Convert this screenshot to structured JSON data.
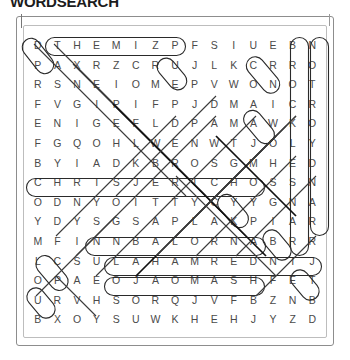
{
  "title": "WORDSEARCH",
  "puzzle": {
    "type": "word-search",
    "rows": 15,
    "cols": 15,
    "grid": [
      [
        "D",
        "T",
        "H",
        "E",
        "M",
        "I",
        "Z",
        "P",
        "F",
        "S",
        "I",
        "U",
        "E",
        "B",
        "N"
      ],
      [
        "P",
        "A",
        "X",
        "R",
        "Z",
        "C",
        "R",
        "U",
        "J",
        "L",
        "K",
        "C",
        "R",
        "R",
        "O"
      ],
      [
        "R",
        "S",
        "N",
        "E",
        "I",
        "O",
        "M",
        "E",
        "P",
        "V",
        "W",
        "O",
        "N",
        "O",
        "T"
      ],
      [
        "F",
        "V",
        "G",
        "I",
        "P",
        "I",
        "F",
        "P",
        "J",
        "D",
        "M",
        "A",
        "I",
        "C",
        "R"
      ],
      [
        "E",
        "N",
        "I",
        "G",
        "E",
        "F",
        "L",
        "D",
        "P",
        "A",
        "M",
        "A",
        "W",
        "K",
        "O"
      ],
      [
        "F",
        "G",
        "Q",
        "O",
        "H",
        "L",
        "W",
        "E",
        "N",
        "W",
        "T",
        "J",
        "O",
        "L",
        "Y"
      ],
      [
        "B",
        "Y",
        "I",
        "A",
        "D",
        "K",
        "B",
        "R",
        "O",
        "S",
        "G",
        "M",
        "H",
        "E",
        "D"
      ],
      [
        "C",
        "H",
        "R",
        "I",
        "S",
        "J",
        "E",
        "R",
        "I",
        "C",
        "H",
        "O",
        "S",
        "S",
        "N"
      ],
      [
        "O",
        "D",
        "N",
        "Y",
        "O",
        "I",
        "T",
        "T",
        "Y",
        "C",
        "Y",
        "Y",
        "G",
        "N",
        "A"
      ],
      [
        "Y",
        "D",
        "Y",
        "S",
        "G",
        "S",
        "A",
        "P",
        "L",
        "A",
        "K",
        "P",
        "I",
        "A",
        "R"
      ],
      [
        "M",
        "F",
        "I",
        "N",
        "N",
        "B",
        "A",
        "L",
        "O",
        "R",
        "N",
        "A",
        "B",
        "R",
        "R"
      ],
      [
        "L",
        "C",
        "S",
        "U",
        "L",
        "A",
        "H",
        "A",
        "M",
        "R",
        "E",
        "D",
        "N",
        "I",
        "J"
      ],
      [
        "O",
        "P",
        "A",
        "E",
        "O",
        "J",
        "A",
        "O",
        "M",
        "A",
        "S",
        "H",
        "F",
        "E",
        "T"
      ],
      [
        "U",
        "R",
        "V",
        "H",
        "S",
        "O",
        "R",
        "Q",
        "J",
        "V",
        "F",
        "B",
        "Z",
        "N",
        "B"
      ],
      [
        "B",
        "X",
        "O",
        "Y",
        "S",
        "U",
        "W",
        "K",
        "H",
        "E",
        "H",
        "J",
        "Y",
        "Z",
        "D"
      ]
    ],
    "found_words": [
      {
        "label": "THEMIZ",
        "orientation": "horizontal",
        "row": 1,
        "start_col": 2,
        "end_col": 7
      },
      {
        "label": "CHRISJERICHO",
        "orientation": "horizontal",
        "row": 8,
        "start_col": 1,
        "end_col": 12
      },
      {
        "label": "FINNBALOR",
        "orientation": "horizontal",
        "row": 11,
        "start_col": 2,
        "end_col": 10
      },
      {
        "label": "ULAHAMREDNI",
        "orientation": "horizontal-reversed",
        "row": 12,
        "start_col": 4,
        "end_col": 14
      },
      {
        "label": "EOJAOMAS",
        "orientation": "horizontal-reversed",
        "row": 13,
        "start_col": 4,
        "end_col": 11
      },
      {
        "label": "BROCKLESNAR",
        "orientation": "vertical",
        "col": 14,
        "start_row": 1,
        "end_row": 11
      },
      {
        "label": "NOTROYDNAR",
        "orientation": "vertical-reversed",
        "col": 15,
        "start_row": 1,
        "end_row": 10
      }
    ],
    "colors": {
      "letter": "#4a4a4a",
      "marking": "#2a2a2a",
      "frame": "#8d8d8d",
      "title": "#1c1c1c"
    }
  }
}
